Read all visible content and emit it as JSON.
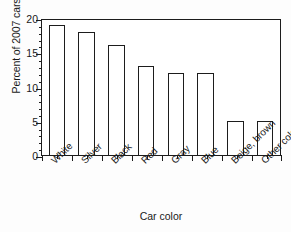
{
  "chart_data": {
    "type": "bar",
    "title": "",
    "xlabel": "Car color",
    "ylabel": "Percent of 2007 cars",
    "categories": [
      "White",
      "Silver",
      "Black",
      "Red",
      "Gray",
      "Blue",
      "Beige, brown",
      "Other colors"
    ],
    "values": [
      19,
      18,
      16,
      13,
      12,
      12,
      5,
      5
    ],
    "ylim": [
      0,
      20
    ],
    "ytick_labels": [
      "0",
      "5",
      "10",
      "15",
      "20"
    ],
    "ytick_values": [
      0,
      5,
      10,
      15,
      20
    ],
    "yminor_step": 1,
    "grid": false,
    "legend": "none",
    "bar_fill": "#ffffff",
    "bar_outline": "#1d1d1d",
    "frame": "full-box",
    "xtick_label_rotation": -45
  }
}
